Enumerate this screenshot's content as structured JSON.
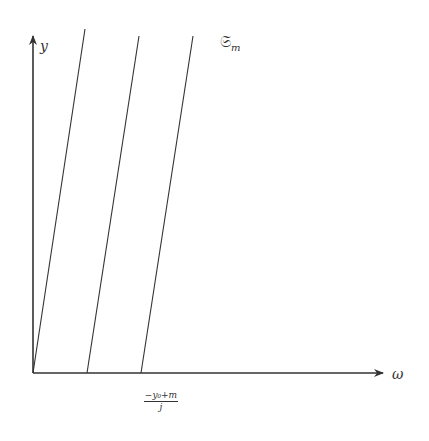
{
  "diagram": {
    "axes": {
      "x_label": "ω",
      "y_label": "y",
      "origin": [
        33,
        373
      ],
      "x_end": [
        383,
        373
      ],
      "y_end": [
        33,
        36
      ]
    },
    "family_label": {
      "symbol": "𝔖",
      "subscript": "m"
    },
    "tick_label": {
      "numerator": "−y₀+m",
      "denominator": "j"
    },
    "lines": [
      {
        "name": "line-1",
        "bottom": [
          33,
          373
        ],
        "top": [
          85,
          29
        ]
      },
      {
        "name": "line-2",
        "bottom": [
          87,
          373
        ],
        "top": [
          139,
          36
        ]
      },
      {
        "name": "line-3",
        "bottom": [
          141,
          373
        ],
        "top": [
          193,
          36
        ]
      }
    ],
    "colors": {
      "stroke": "#333333",
      "background": "#ffffff"
    }
  }
}
